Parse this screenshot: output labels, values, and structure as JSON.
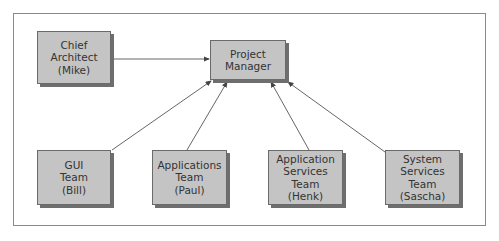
{
  "diagram": {
    "type": "org-chart",
    "nodes": [
      {
        "id": "chief_architect",
        "label": "Chief\nArchitect\n(Mike)"
      },
      {
        "id": "project_manager",
        "label": "Project\nManager"
      },
      {
        "id": "gui_team",
        "label": "GUI\nTeam\n(Bill)"
      },
      {
        "id": "applications_team",
        "label": "Applications\nTeam\n(Paul)"
      },
      {
        "id": "application_services_team",
        "label": "Application\nServices Team\n(Henk)"
      },
      {
        "id": "system_services_team",
        "label": "System\nServices Team\n(Sascha)"
      }
    ],
    "edges": [
      {
        "from": "chief_architect",
        "to": "project_manager"
      },
      {
        "from": "gui_team",
        "to": "project_manager"
      },
      {
        "from": "applications_team",
        "to": "project_manager"
      },
      {
        "from": "application_services_team",
        "to": "project_manager"
      },
      {
        "from": "system_services_team",
        "to": "project_manager"
      }
    ],
    "colors": {
      "node_fill": "#c4c4c4",
      "node_border": "#6a6a6a",
      "shadow": "#6e6e6e",
      "line": "#555555"
    }
  }
}
